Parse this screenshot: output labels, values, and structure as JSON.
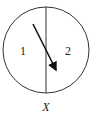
{
  "diagram": {
    "regions": [
      {
        "id": "1",
        "label": "1"
      },
      {
        "id": "2",
        "label": "2"
      }
    ],
    "axis_label": "X",
    "shapes": {
      "circle": {
        "cx": 46,
        "cy": 50,
        "r": 43
      },
      "divider": {
        "x": 46,
        "y1": 7,
        "y2": 93
      },
      "arrow": {
        "x1": 33,
        "y1": 24,
        "x2": 57,
        "y2": 72,
        "direction": "from region 1 to region 2"
      }
    },
    "colors": {
      "stroke": "#333333",
      "arrow": "#111111"
    }
  }
}
